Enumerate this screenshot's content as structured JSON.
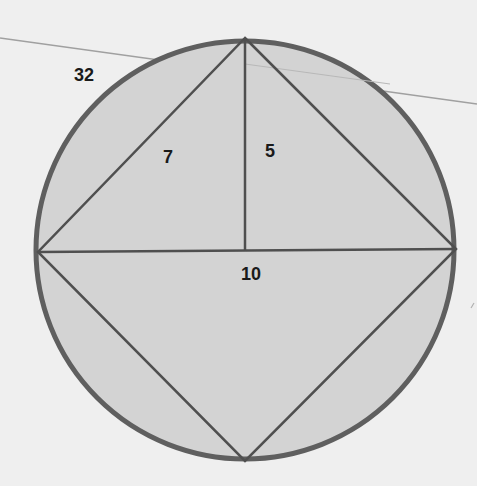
{
  "diagram": {
    "colors": {
      "background": "#efefef",
      "circle_fill": "#d3d3d3",
      "circle_stroke": "#5f5f5f",
      "line_stroke": "#4f4f4f",
      "stray_line": "#9a9a9a",
      "label": "#1a1a1a"
    },
    "circle": {
      "cx": 245,
      "cy": 250,
      "r": 210
    },
    "vertices": {
      "top": [
        245,
        38
      ],
      "right": [
        456,
        249
      ],
      "bottom": [
        245,
        461
      ],
      "left": [
        38,
        252
      ],
      "center_foot": [
        245,
        248
      ]
    },
    "labels": {
      "outside": {
        "text": "32",
        "x": 84,
        "y": 75
      },
      "left_side": {
        "text": "7",
        "x": 168,
        "y": 157
      },
      "altitude": {
        "text": "5",
        "x": 270,
        "y": 151
      },
      "diagonal": {
        "text": "10",
        "x": 251,
        "y": 274
      }
    }
  }
}
